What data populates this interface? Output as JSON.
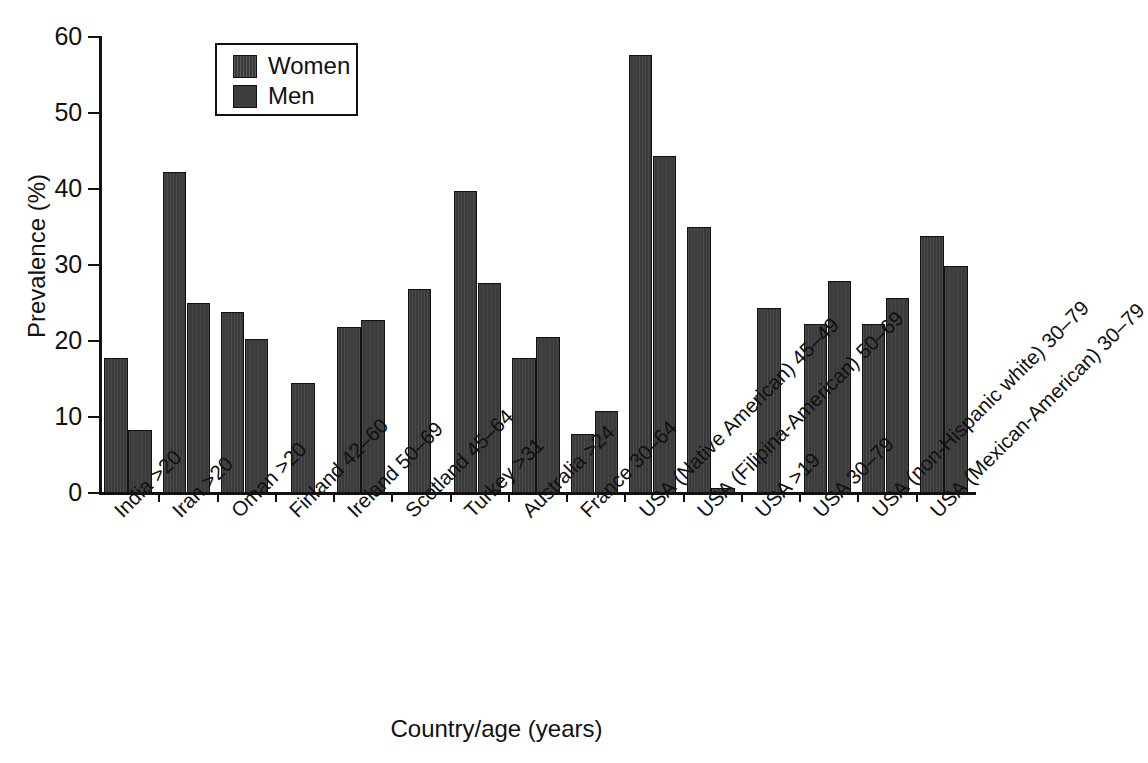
{
  "chart_data": {
    "type": "bar",
    "title": "",
    "xlabel": "Country/age (years)",
    "ylabel": "Prevalence (%)",
    "ylim": [
      0,
      60
    ],
    "yticks": [
      0,
      10,
      20,
      30,
      40,
      50,
      60
    ],
    "grid": false,
    "legend_position": "top-left-inside",
    "categories": [
      "India >20",
      "Iran >20",
      "Oman >20",
      "Finland 42–60",
      "Ireland 50–69",
      "Scotland 45–64",
      "Turkey >31",
      "Australia >24",
      "France 30–64",
      "USA (Native American) 45–49",
      "USA (Filipina-American) 50–69",
      "USA >19",
      "USA 30–79",
      "USA (non-Hispanic white) 30–79",
      "USA (Mexican-American) 30–79"
    ],
    "series": [
      {
        "name": "Women",
        "color": "#3a3a3a",
        "values": [
          17.8,
          42.3,
          23.8,
          14.5,
          21.9,
          26.8,
          39.7,
          17.8,
          7.8,
          57.6,
          35.0,
          24.3,
          22.3,
          22.3,
          33.8
        ]
      },
      {
        "name": "Men",
        "color": "#3c3c3c",
        "values": [
          8.3,
          25.0,
          20.2,
          null,
          22.7,
          null,
          27.6,
          20.5,
          10.8,
          44.4,
          0.7,
          null,
          27.9,
          25.7,
          29.9
        ]
      }
    ]
  },
  "legend": {
    "items": [
      {
        "label": "Women",
        "swatch": "women-swatch"
      },
      {
        "label": "Men",
        "swatch": "men-swatch"
      }
    ]
  },
  "axes": {
    "y_title": "Prevalence (%)",
    "x_title": "Country/age (years)",
    "y_tick_labels": [
      "0",
      "10",
      "20",
      "30",
      "40",
      "50",
      "60"
    ]
  }
}
